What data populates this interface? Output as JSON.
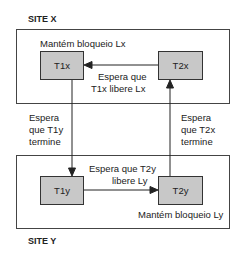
{
  "site_x": {
    "label": "SITE X",
    "lock_note": "Mantém bloqueio Lx",
    "t1": "T1x",
    "t2": "T2x",
    "wait_line1": "Espera que",
    "wait_line2": "T1x libere Lx"
  },
  "site_y": {
    "label": "SITE Y",
    "lock_note": "Mantém bloqueio Ly",
    "t1": "T1y",
    "t2": "T2y",
    "wait_line1": "Espera que T2y",
    "wait_line2": "libere Ly"
  },
  "between": {
    "left_line1": "Espera",
    "left_line2": "que T1y",
    "left_line3": "termine",
    "right_line1": "Espera",
    "right_line2": "que T2x",
    "right_line3": "termine"
  }
}
